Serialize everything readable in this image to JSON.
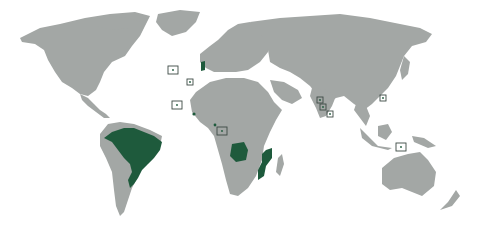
{
  "map": {
    "title": "",
    "projection": "world",
    "colors": {
      "background": "#ffffff",
      "land": "#a3a7a5",
      "highlight": "#1e5a3c",
      "marker": "#3d4a44"
    },
    "highlighted_regions": [
      {
        "name": "Brazil",
        "type": "country"
      },
      {
        "name": "Portugal",
        "type": "country"
      },
      {
        "name": "Angola",
        "type": "country"
      },
      {
        "name": "Mozambique",
        "type": "country"
      },
      {
        "name": "Guinea-Bissau",
        "type": "country"
      },
      {
        "name": "Equatorial Guinea",
        "type": "country"
      }
    ],
    "boxed_markers": [
      {
        "name": "Azores",
        "x": 173,
        "y": 70
      },
      {
        "name": "Madeira",
        "x": 190,
        "y": 82
      },
      {
        "name": "Cape Verde",
        "x": 177,
        "y": 105
      },
      {
        "name": "São Tomé and Príncipe",
        "x": 222,
        "y": 131
      },
      {
        "name": "Goa",
        "x": 320,
        "y": 100
      },
      {
        "name": "Daman and Diu",
        "x": 323,
        "y": 107
      },
      {
        "name": "Sri Lanka area",
        "x": 330,
        "y": 114
      },
      {
        "name": "Macau",
        "x": 383,
        "y": 98
      },
      {
        "name": "East Timor",
        "x": 401,
        "y": 147
      }
    ]
  }
}
